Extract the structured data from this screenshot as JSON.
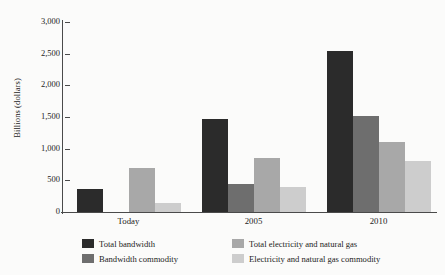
{
  "chart_data": {
    "type": "bar",
    "title": "",
    "xlabel": "",
    "ylabel": "Billions (dollars)",
    "ylim": [
      0,
      3000
    ],
    "grid": false,
    "legend_position": "bottom",
    "categories": [
      "Today",
      "2005",
      "2010"
    ],
    "ytick_labels": [
      "3,000",
      "2,500",
      "2,000",
      "1,500",
      "1,000",
      "500",
      "0"
    ],
    "ytick_values": [
      3000,
      2500,
      2000,
      1500,
      1000,
      500,
      0
    ],
    "series": [
      {
        "name": "Total bandwidth",
        "color": "#2b2b2b",
        "values": [
          370,
          1470,
          2550
        ]
      },
      {
        "name": "Bandwidth commodity",
        "color": "#6e6e6e",
        "values": [
          0,
          450,
          1520
        ]
      },
      {
        "name": "Total electricity and natural gas",
        "color": "#a8a8a8",
        "values": [
          700,
          860,
          1100
        ]
      },
      {
        "name": "Electricity and natural gas commodity",
        "color": "#cdcdcd",
        "values": [
          150,
          390,
          800
        ]
      }
    ]
  }
}
